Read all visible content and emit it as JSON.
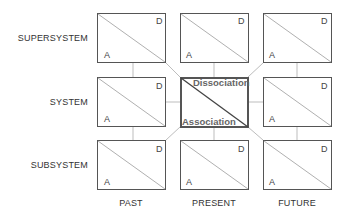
{
  "rows": [
    {
      "label": "SUPERSYSTEM"
    },
    {
      "label": "SYSTEM"
    },
    {
      "label": "SUBSYSTEM"
    }
  ],
  "columns": [
    {
      "label": "PAST"
    },
    {
      "label": "PRESENT"
    },
    {
      "label": "FUTURE"
    }
  ],
  "cell": {
    "top_right": "D",
    "bottom_left": "A"
  },
  "center": {
    "top_label": "Dissociation",
    "bottom_label": "Association"
  },
  "colors": {
    "box_border": "#555555",
    "diagonal": "#aaaaaa",
    "connector": "#bbbbbb",
    "center_diagonal": "#444444"
  }
}
